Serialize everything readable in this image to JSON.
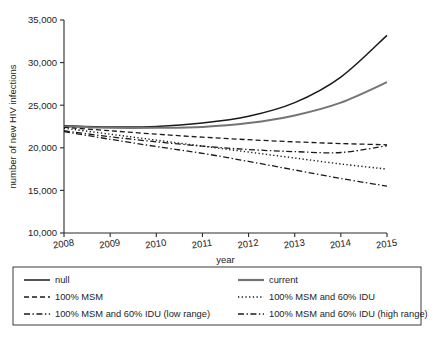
{
  "chart_data": {
    "type": "line",
    "title": "",
    "xlabel": "year",
    "ylabel": "number of new HIV infections",
    "x": [
      2008,
      2009,
      2010,
      2011,
      2012,
      2013,
      2014,
      2015
    ],
    "xlim": [
      2008,
      2015
    ],
    "ylim": [
      10000,
      35000
    ],
    "yticks": [
      10000,
      15000,
      20000,
      25000,
      30000,
      35000
    ],
    "ytick_labels": [
      "10,000",
      "15,000",
      "20,000",
      "25,000",
      "30,000",
      "35,000"
    ],
    "xticks": [
      2008,
      2009,
      2010,
      2011,
      2012,
      2013,
      2014,
      2015
    ],
    "xtick_labels": [
      "2008",
      "2009",
      "2010",
      "2011",
      "2012",
      "2013",
      "2014",
      "2015"
    ],
    "grid": false,
    "legend_position": "below",
    "series": [
      {
        "name": "null",
        "style": "solid",
        "color": "#1a1a1a",
        "width": 1.5,
        "values": [
          22600,
          22450,
          22500,
          22900,
          23700,
          25300,
          28300,
          33200
        ]
      },
      {
        "name": "current",
        "style": "solid",
        "color": "#747474",
        "width": 2.0,
        "values": [
          22500,
          22350,
          22350,
          22450,
          22900,
          23800,
          25300,
          27700
        ]
      },
      {
        "name": "100% MSM",
        "style": "dashed",
        "color": "#1a1a1a",
        "width": 1.3,
        "values": [
          22400,
          22000,
          21600,
          21250,
          20950,
          20700,
          20500,
          20350
        ]
      },
      {
        "name": "100% MSM and 60% IDU",
        "style": "dotted",
        "color": "#1a1a1a",
        "width": 1.4,
        "values": [
          22300,
          21600,
          20900,
          20200,
          19500,
          18800,
          18100,
          17500
        ]
      },
      {
        "name": "100% MSM and 60% IDU (low range)",
        "style": "dash-dot",
        "color": "#1a1a1a",
        "width": 1.3,
        "values": [
          22000,
          21300,
          20700,
          20200,
          19800,
          19550,
          19450,
          20250
        ]
      },
      {
        "name": "100% MSM and 60% IDU (high range)",
        "style": "dash-dot",
        "color": "#1a1a1a",
        "width": 1.3,
        "values": [
          21900,
          21000,
          20150,
          19350,
          18400,
          17400,
          16400,
          15500
        ]
      }
    ]
  },
  "legend": {
    "entries": [
      {
        "label": "null",
        "style": "solid",
        "color": "#1a1a1a",
        "width": 1.5
      },
      {
        "label": "current",
        "style": "solid",
        "color": "#747474",
        "width": 2.2
      },
      {
        "label": "100% MSM",
        "style": "dashed",
        "color": "#1a1a1a",
        "width": 1.3
      },
      {
        "label": "100% MSM and 60% IDU",
        "style": "dotted",
        "color": "#1a1a1a",
        "width": 1.5
      },
      {
        "label": "100% MSM and 60% IDU (low range)",
        "style": "dash-dot",
        "color": "#1a1a1a",
        "width": 1.3
      },
      {
        "label": "100% MSM and 60% IDU (high range)",
        "style": "dash-dot",
        "color": "#1a1a1a",
        "width": 1.3
      }
    ]
  },
  "colors": {
    "axis": "#2b2b2b",
    "text": "#1c1c1c",
    "background": "#ffffff",
    "null_series": "#1a1a1a",
    "current_series": "#747474"
  }
}
